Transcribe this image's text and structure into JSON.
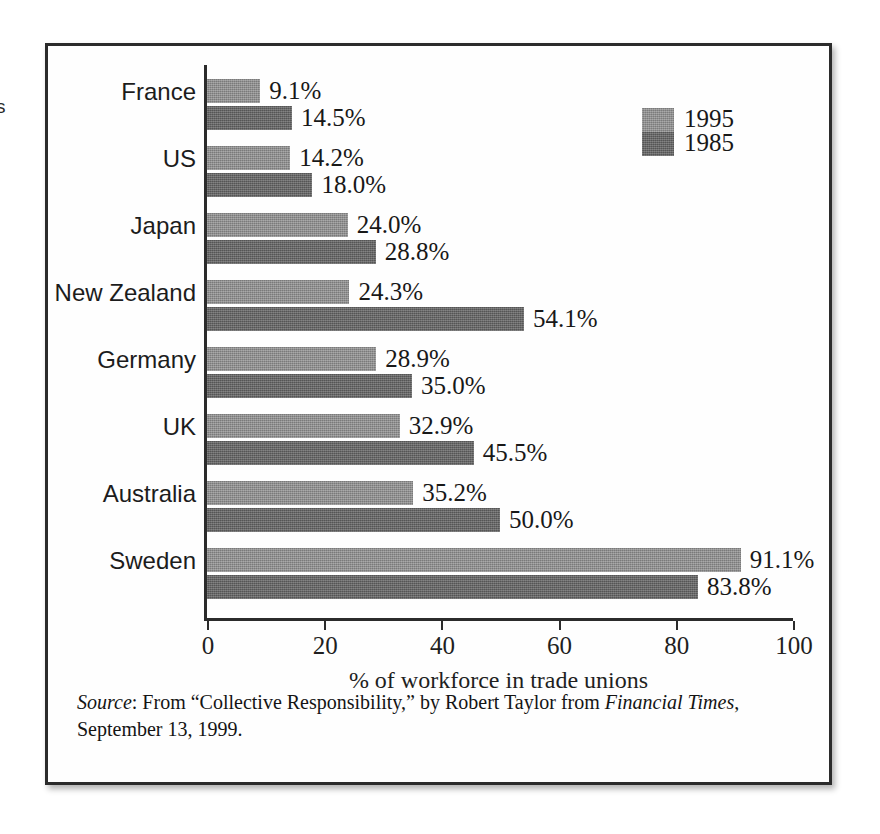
{
  "page": {
    "bleed_text": "s"
  },
  "chart_data": {
    "type": "bar",
    "orientation": "horizontal",
    "title": "",
    "xlabel": "% of workforce in trade unions",
    "ylabel": "",
    "xlim": [
      0,
      100
    ],
    "xticks": [
      0,
      20,
      40,
      60,
      80,
      100
    ],
    "xtick_labels": [
      "0",
      "20",
      "40",
      "60",
      "80",
      "100"
    ],
    "grid": false,
    "legend_position": "top-right",
    "categories": [
      "France",
      "US",
      "Japan",
      "New Zealand",
      "Germany",
      "UK",
      "Australia",
      "Sweden"
    ],
    "series": [
      {
        "name": "1995",
        "color": "#8c8c8c",
        "values": [
          9.1,
          14.2,
          24.0,
          24.3,
          28.9,
          32.9,
          35.2,
          91.1
        ],
        "labels": [
          "9.1%",
          "14.2%",
          "24.0%",
          "24.3%",
          "28.9%",
          "32.9%",
          "35.2%",
          "91.1%"
        ]
      },
      {
        "name": "1985",
        "color": "#666666",
        "values": [
          14.5,
          18.0,
          28.8,
          54.1,
          35.0,
          45.5,
          50.0,
          83.8
        ],
        "labels": [
          "14.5%",
          "18.0%",
          "28.8%",
          "54.1%",
          "35.0%",
          "45.5%",
          "50.0%",
          "83.8%"
        ]
      }
    ]
  },
  "legend": {
    "entries": [
      {
        "label": "1995",
        "color": "#8c8c8c"
      },
      {
        "label": "1985",
        "color": "#666666"
      }
    ]
  },
  "source_note": {
    "label": "Source",
    "colon": ": ",
    "text_before": "From “Collective Responsibility,” by Robert Taylor from ",
    "publication": "Financial Times",
    "text_after": ", September 13, 1999."
  }
}
